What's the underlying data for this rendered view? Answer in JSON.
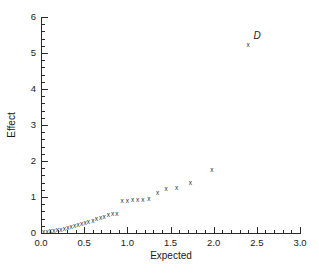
{
  "chart_data": {
    "type": "scatter",
    "title": "",
    "xlabel": "Expected",
    "ylabel": "Effect",
    "xlim": [
      0.0,
      3.0
    ],
    "ylim": [
      0,
      6
    ],
    "grid": false,
    "legend": null,
    "marker_symbol": "x",
    "marker_color": "#2b2b2b",
    "xticks": [
      "0.0",
      "0.5",
      "1.0",
      "1.5",
      "2.0",
      "2.5",
      "3.0"
    ],
    "xtick_values": [
      0.0,
      0.5,
      1.0,
      1.5,
      2.0,
      2.5,
      3.0
    ],
    "xminor_step": 0.1,
    "yticks": [
      "0",
      "1",
      "2",
      "3",
      "4",
      "5",
      "6"
    ],
    "ytick_values": [
      0,
      1,
      2,
      3,
      4,
      5,
      6
    ],
    "yminor_step": 0.2,
    "points": [
      {
        "x": 0.03,
        "y": 0.03
      },
      {
        "x": 0.07,
        "y": 0.05
      },
      {
        "x": 0.11,
        "y": 0.06
      },
      {
        "x": 0.15,
        "y": 0.08
      },
      {
        "x": 0.19,
        "y": 0.09
      },
      {
        "x": 0.23,
        "y": 0.11
      },
      {
        "x": 0.27,
        "y": 0.13
      },
      {
        "x": 0.31,
        "y": 0.15
      },
      {
        "x": 0.35,
        "y": 0.18
      },
      {
        "x": 0.39,
        "y": 0.21
      },
      {
        "x": 0.43,
        "y": 0.24
      },
      {
        "x": 0.47,
        "y": 0.27
      },
      {
        "x": 0.51,
        "y": 0.29
      },
      {
        "x": 0.55,
        "y": 0.32
      },
      {
        "x": 0.6,
        "y": 0.36
      },
      {
        "x": 0.64,
        "y": 0.39
      },
      {
        "x": 0.69,
        "y": 0.44
      },
      {
        "x": 0.73,
        "y": 0.47
      },
      {
        "x": 0.78,
        "y": 0.52
      },
      {
        "x": 0.83,
        "y": 0.54
      },
      {
        "x": 0.88,
        "y": 0.55
      },
      {
        "x": 0.94,
        "y": 0.89
      },
      {
        "x": 1.0,
        "y": 0.9
      },
      {
        "x": 1.06,
        "y": 0.93
      },
      {
        "x": 1.12,
        "y": 0.94
      },
      {
        "x": 1.18,
        "y": 0.94
      },
      {
        "x": 1.25,
        "y": 0.96
      },
      {
        "x": 1.35,
        "y": 1.12
      },
      {
        "x": 1.45,
        "y": 1.25
      },
      {
        "x": 1.57,
        "y": 1.26
      },
      {
        "x": 1.73,
        "y": 1.39
      },
      {
        "x": 1.98,
        "y": 1.77
      },
      {
        "x": 2.4,
        "y": 5.25,
        "label": "D"
      }
    ],
    "annotations": [
      {
        "text": "D",
        "x": 2.46,
        "y": 5.48,
        "style": "italic"
      }
    ]
  }
}
